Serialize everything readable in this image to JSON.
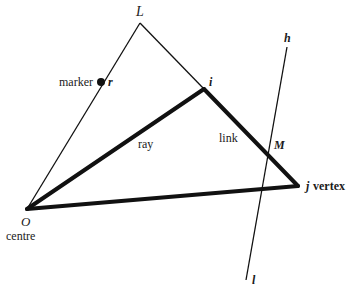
{
  "diagram": {
    "points": {
      "L": {
        "label": "L"
      },
      "i": {
        "label": "i"
      },
      "r": {
        "label": "r"
      },
      "O": {
        "label": "O"
      },
      "j": {
        "label": "j"
      },
      "M": {
        "label": "M"
      },
      "h": {
        "label": "h"
      },
      "l": {
        "label": "l"
      }
    },
    "annotations": {
      "marker": "marker",
      "ray": "ray",
      "link": "link",
      "vertex": "vertex",
      "centre": "centre"
    },
    "colors": {
      "ink": "#111111",
      "background": "#ffffff"
    }
  }
}
